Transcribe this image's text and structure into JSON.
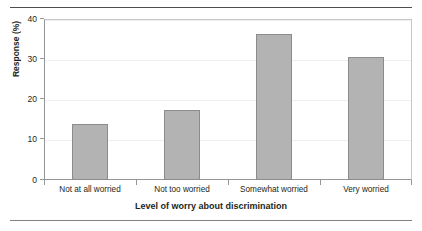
{
  "chart_data": {
    "type": "bar",
    "title": "",
    "xlabel": "Level of worry about discrimination",
    "ylabel": "Response (%)",
    "categories": [
      "Not at all worried",
      "Not too worried",
      "Somewhat worried",
      "Very worried"
    ],
    "values": [
      13.9,
      17.4,
      36.3,
      30.5
    ],
    "ylim": [
      0,
      40
    ],
    "yticks": [
      0,
      10,
      20,
      30,
      40
    ],
    "ytick_labels": [
      "0",
      "10",
      "20",
      "30",
      "40"
    ],
    "grid": true,
    "legend": false,
    "legend_position": "none",
    "colors": {
      "bar_fill": "#b3b3b3",
      "bar_border": "#8b8c8e",
      "axis": "#939598",
      "gridline": "#eeeff0",
      "text": "#231f20",
      "rule": "#58595b"
    }
  }
}
